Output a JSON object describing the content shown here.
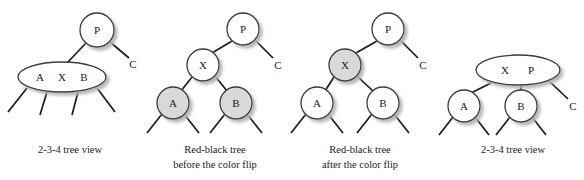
{
  "figure": {
    "background_color": "#ffffff",
    "node_stroke_color": "#333333",
    "node_fill_white": "#ffffff",
    "node_fill_shaded": "#d9d9d9",
    "edge_color": "#1a1a1a",
    "shadow_color": "#bbbbbb",
    "text_color": "#1a1a1a"
  },
  "panels": [
    {
      "id": "panel-1",
      "caption": [
        "2-3-4 tree view"
      ],
      "nodes": [
        {
          "id": "p1-P",
          "label": "P",
          "shape": "circle",
          "fill": "white",
          "cx": 97,
          "cy": 30,
          "r": 17
        },
        {
          "id": "p1-AXB",
          "label": "A  X  B",
          "shape": "ellipse",
          "fill": "white",
          "cx": 62,
          "cy": 77,
          "rx": 44,
          "ry": 15
        }
      ],
      "external_labels": [
        {
          "id": "p1-C",
          "label": "C",
          "x": 133,
          "y": 64
        }
      ]
    },
    {
      "id": "panel-2",
      "caption": [
        "Red-black tree",
        "before the color flip"
      ],
      "nodes": [
        {
          "id": "p2-P",
          "label": "P",
          "shape": "circle",
          "fill": "white",
          "cx": 243,
          "cy": 29,
          "r": 16
        },
        {
          "id": "p2-X",
          "label": "X",
          "shape": "circle",
          "fill": "white",
          "cx": 203,
          "cy": 65,
          "r": 16
        },
        {
          "id": "p2-A",
          "label": "A",
          "shape": "circle",
          "fill": "shaded",
          "cx": 173,
          "cy": 103,
          "r": 16
        },
        {
          "id": "p2-B",
          "label": "B",
          "shape": "circle",
          "fill": "shaded",
          "cx": 236,
          "cy": 103,
          "r": 16
        }
      ],
      "external_labels": [
        {
          "id": "p2-C",
          "label": "C",
          "x": 277,
          "y": 65
        }
      ]
    },
    {
      "id": "panel-3",
      "caption": [
        "Red-black tree",
        "after the color flip"
      ],
      "nodes": [
        {
          "id": "p3-P",
          "label": "P",
          "shape": "circle",
          "fill": "white",
          "cx": 388,
          "cy": 29,
          "r": 16
        },
        {
          "id": "p3-X",
          "label": "X",
          "shape": "circle",
          "fill": "shaded",
          "cx": 345,
          "cy": 65,
          "r": 16
        },
        {
          "id": "p3-A",
          "label": "A",
          "shape": "circle",
          "fill": "white",
          "cx": 317,
          "cy": 103,
          "r": 16
        },
        {
          "id": "p3-B",
          "label": "B",
          "shape": "circle",
          "fill": "white",
          "cx": 383,
          "cy": 103,
          "r": 16
        }
      ],
      "external_labels": [
        {
          "id": "p3-C",
          "label": "C",
          "x": 422,
          "y": 65
        }
      ]
    },
    {
      "id": "panel-4",
      "caption": [
        "2-3-4 tree view"
      ],
      "nodes": [
        {
          "id": "p4-XP",
          "label": "X    P",
          "shape": "ellipse",
          "fill": "white",
          "cx": 518,
          "cy": 70,
          "rx": 42,
          "ry": 15
        },
        {
          "id": "p4-A",
          "label": "A",
          "shape": "circle",
          "fill": "white",
          "cx": 464,
          "cy": 106,
          "r": 16
        },
        {
          "id": "p4-B",
          "label": "B",
          "shape": "circle",
          "fill": "white",
          "cx": 521,
          "cy": 106,
          "r": 16
        }
      ],
      "external_labels": [
        {
          "id": "p4-C",
          "label": "C",
          "x": 572,
          "y": 106
        }
      ]
    }
  ],
  "captions": {
    "panel_1": {
      "line1": "2-3-4 tree view"
    },
    "panel_2": {
      "line1": "Red-black tree",
      "line2": "before the color flip"
    },
    "panel_3": {
      "line1": "Red-black tree",
      "line2": "after the color flip"
    },
    "panel_4": {
      "line1": "2-3-4 tree view"
    }
  },
  "labels": {
    "p1_P": "P",
    "p1_A": "A",
    "p1_X": "X",
    "p1_B": "B",
    "p1_C": "C",
    "p2_P": "P",
    "p2_X": "X",
    "p2_A": "A",
    "p2_B": "B",
    "p2_C": "C",
    "p3_P": "P",
    "p3_X": "X",
    "p3_A": "A",
    "p3_B": "B",
    "p3_C": "C",
    "p4_X": "X",
    "p4_P": "P",
    "p4_A": "A",
    "p4_B": "B",
    "p4_C": "C"
  }
}
